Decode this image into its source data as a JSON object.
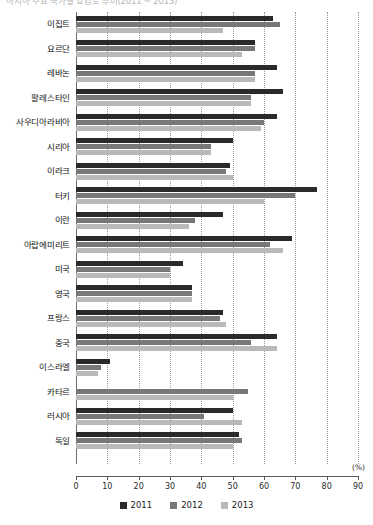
{
  "title": "아시아 주요 국가별 호감도 추이(2011 ~ 2013)",
  "axis": {
    "x_ticks": [
      "0",
      "10",
      "20",
      "30",
      "40",
      "50",
      "60",
      "70",
      "80",
      "90"
    ],
    "unit_label": "(%)",
    "xmin": 0,
    "xmax": 90,
    "step": 10
  },
  "legend": {
    "items": [
      {
        "label": "2011",
        "color": "#2a2a2a",
        "swatch": "legend-swatch-2011"
      },
      {
        "label": "2012",
        "color": "#787878",
        "swatch": "legend-swatch-2012"
      },
      {
        "label": "2013",
        "color": "#b9b9b9",
        "swatch": "legend-swatch-2013"
      }
    ]
  },
  "chart_data": {
    "type": "bar",
    "orientation": "horizontal",
    "title": "아시아 주요 국가별 호감도 추이(2011 ~ 2013)",
    "xlabel": "(%)",
    "ylabel": "",
    "xlim": [
      0,
      90
    ],
    "xticks": [
      0,
      10,
      20,
      30,
      40,
      50,
      60,
      70,
      80,
      90
    ],
    "grid": "vertical-dotted",
    "legend_position": "bottom-center",
    "categories": [
      "이집트",
      "요르단",
      "레바논",
      "팔레스타인",
      "사우디아라비아",
      "시리아",
      "이라크",
      "터키",
      "이란",
      "아랍에미리트",
      "미국",
      "영국",
      "프랑스",
      "중국",
      "이스라엘",
      "카타르",
      "러시아",
      "독일"
    ],
    "series": [
      {
        "name": "2011",
        "color": "#2a2a2a",
        "values": [
          63,
          57,
          64,
          66,
          64,
          50,
          49,
          77,
          47,
          69,
          34,
          37,
          47,
          64,
          11,
          0,
          50,
          52
        ]
      },
      {
        "name": "2012",
        "color": "#787878",
        "values": [
          65,
          57,
          57,
          56,
          60,
          43,
          48,
          70,
          38,
          62,
          30,
          37,
          46,
          56,
          8,
          55,
          41,
          53
        ]
      },
      {
        "name": "2013",
        "color": "#b9b9b9",
        "values": [
          47,
          53,
          57,
          56,
          59,
          43,
          50,
          60,
          36,
          66,
          30,
          37,
          48,
          64,
          7,
          50,
          53,
          50
        ]
      }
    ]
  }
}
